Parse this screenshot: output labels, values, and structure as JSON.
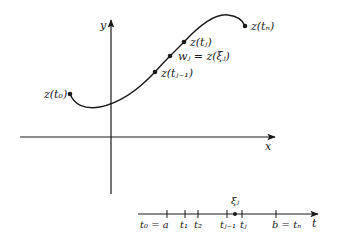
{
  "diagram": {
    "type": "contour-partition",
    "colors": {
      "ink": "#1a1a1a",
      "background": "#ffffff"
    },
    "axes": {
      "x_label": "x",
      "y_label": "y",
      "t_label": "t"
    },
    "curve_points": [
      {
        "id": "z_t0",
        "label": "z(t₀)"
      },
      {
        "id": "z_tj_minus_1",
        "label": "z(tⱼ₋₁)"
      },
      {
        "id": "w_j",
        "label": "wⱼ = z(ξⱼ)"
      },
      {
        "id": "z_tj",
        "label": "z(tⱼ)"
      },
      {
        "id": "z_tn",
        "label": "z(tₙ)"
      }
    ],
    "t_axis": {
      "xi_label": "ξⱼ",
      "ticks": [
        {
          "id": "t0",
          "label": "t₀ = a"
        },
        {
          "id": "t1",
          "label": "t₁"
        },
        {
          "id": "t2",
          "label": "t₂"
        },
        {
          "id": "tj_minus_1",
          "label": "tⱼ₋₁"
        },
        {
          "id": "tj",
          "label": "tⱼ"
        },
        {
          "id": "tn",
          "label": "b = tₙ"
        }
      ]
    }
  }
}
